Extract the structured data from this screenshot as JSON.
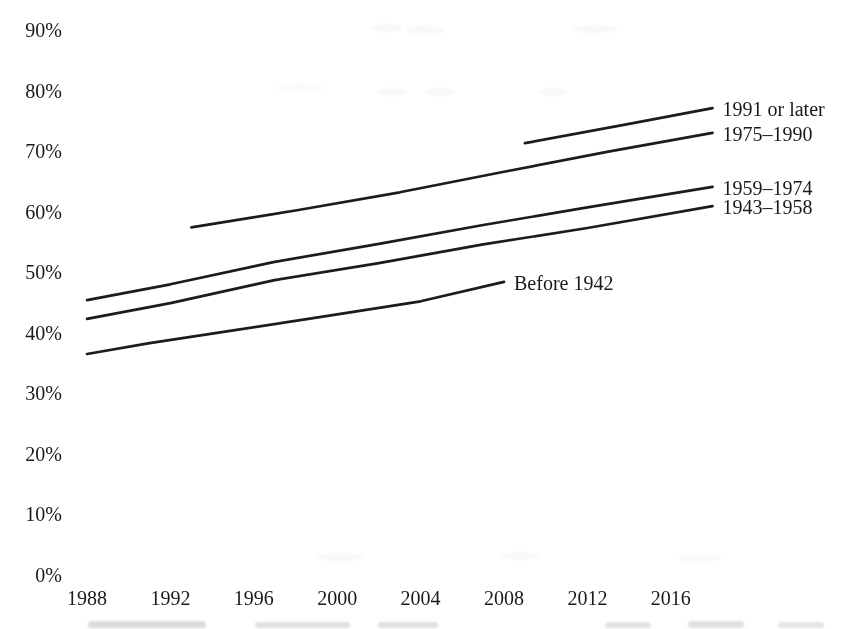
{
  "chart_data": {
    "type": "line",
    "title": "",
    "xlabel": "",
    "ylabel": "",
    "x_range": [
      1988,
      2018
    ],
    "y_range": [
      0,
      90
    ],
    "y_unit": "%",
    "grid": false,
    "axis_lines": false,
    "legend_position": "end-of-line-labels",
    "line_color": "#1c1c1c",
    "text_color": "#1a1a1a",
    "background_color": "#ffffff",
    "y_ticks": [
      {
        "v": 90,
        "label": "90%"
      },
      {
        "v": 80,
        "label": "80%"
      },
      {
        "v": 70,
        "label": "70%"
      },
      {
        "v": 60,
        "label": "60%"
      },
      {
        "v": 50,
        "label": "50%"
      },
      {
        "v": 40,
        "label": "40%"
      },
      {
        "v": 30,
        "label": "30%"
      },
      {
        "v": 20,
        "label": "20%"
      },
      {
        "v": 10,
        "label": "10%"
      },
      {
        "v": 0,
        "label": "0%"
      }
    ],
    "x_ticks": [
      {
        "v": 1988,
        "label": "1988"
      },
      {
        "v": 1992,
        "label": "1992"
      },
      {
        "v": 1996,
        "label": "1996"
      },
      {
        "v": 2000,
        "label": "2000"
      },
      {
        "v": 2004,
        "label": "2004"
      },
      {
        "v": 2008,
        "label": "2008"
      },
      {
        "v": 2012,
        "label": "2012"
      },
      {
        "v": 2016,
        "label": "2016"
      }
    ],
    "series": [
      {
        "name": "1991-or-later",
        "label": "1991 or later",
        "points": [
          [
            2009,
            71.3
          ],
          [
            2014,
            74.5
          ],
          [
            2018,
            77.1
          ]
        ]
      },
      {
        "name": "1975-1990",
        "label": "1975–1990",
        "points": [
          [
            1993,
            57.4
          ],
          [
            1998,
            60.2
          ],
          [
            2003,
            63.2
          ],
          [
            2008,
            66.6
          ],
          [
            2013,
            69.9
          ],
          [
            2018,
            73.0
          ]
        ]
      },
      {
        "name": "1959-1974",
        "label": "1959–1974",
        "points": [
          [
            1988,
            45.4
          ],
          [
            1992,
            48.0
          ],
          [
            1997,
            51.7
          ],
          [
            2002,
            54.7
          ],
          [
            2007,
            57.8
          ],
          [
            2012,
            60.7
          ],
          [
            2018,
            64.1
          ]
        ]
      },
      {
        "name": "1943-1958",
        "label": "1943–1958",
        "points": [
          [
            1988,
            42.3
          ],
          [
            1992,
            44.9
          ],
          [
            1997,
            48.7
          ],
          [
            2002,
            51.5
          ],
          [
            2007,
            54.6
          ],
          [
            2012,
            57.3
          ],
          [
            2018,
            60.9
          ]
        ]
      },
      {
        "name": "before-1942",
        "label": "Before 1942",
        "points": [
          [
            1988,
            36.5
          ],
          [
            1991,
            38.3
          ],
          [
            1999,
            42.5
          ],
          [
            2004,
            45.2
          ],
          [
            2008,
            48.4
          ]
        ]
      }
    ]
  }
}
